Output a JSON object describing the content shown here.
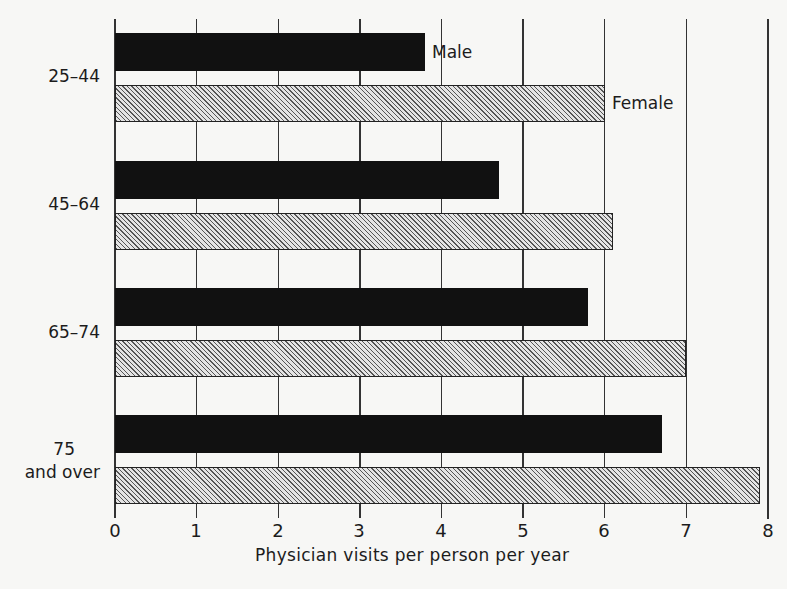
{
  "chart_data": {
    "type": "bar",
    "orientation": "horizontal",
    "title": "",
    "xlabel": "Physician visits per person per year",
    "ylabel": "",
    "xlim": [
      0,
      8
    ],
    "xticks": [
      "0",
      "1",
      "2",
      "3",
      "4",
      "5",
      "6",
      "7",
      "8"
    ],
    "grid": true,
    "categories": [
      "25-44",
      "45-64",
      "65-74",
      "75 and over"
    ],
    "category_labels": [
      [
        "25-44"
      ],
      [
        "45-64"
      ],
      [
        "65-74"
      ],
      [
        "75",
        "and over"
      ]
    ],
    "series": [
      {
        "name": "Male",
        "pattern": "solid",
        "color": "#111111",
        "values": [
          3.8,
          4.7,
          5.8,
          6.7
        ]
      },
      {
        "name": "Female",
        "pattern": "diagonal-hatch",
        "color": "#e4e4e4",
        "values": [
          6.0,
          6.1,
          7.0,
          7.9
        ]
      }
    ],
    "legend": {
      "position": "inline-annotations",
      "annotations": [
        {
          "text": "Male",
          "attached_to": "Male 25-44 bar end"
        },
        {
          "text": "Female",
          "attached_to": "Female 25-44 bar end"
        }
      ]
    }
  },
  "labels": {
    "male": "Male",
    "female": "Female",
    "xlabel": "Physician visits per person per year",
    "cat0": "25–44",
    "cat1": "45–64",
    "cat2": "65–74",
    "cat3a": "75",
    "cat3b": "and over",
    "t0": "0",
    "t1": "1",
    "t2": "2",
    "t3": "3",
    "t4": "4",
    "t5": "5",
    "t6": "6",
    "t7": "7",
    "t8": "8"
  }
}
